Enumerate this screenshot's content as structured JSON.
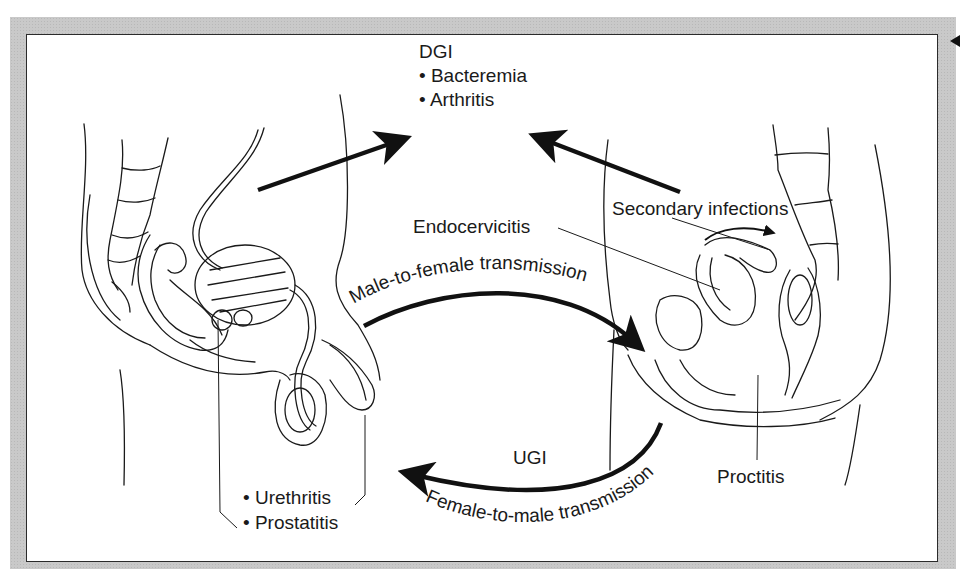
{
  "figure": {
    "top_group": {
      "heading": "DGI",
      "items": [
        "• Bacteremia",
        "• Arthritis"
      ]
    },
    "male": {
      "items": [
        "• Urethritis",
        "• Prostatitis"
      ]
    },
    "female": {
      "secondary": "Secondary infections",
      "endocervicitis": "Endocervicitis",
      "proctitis": "Proctitis"
    },
    "arrows": {
      "male_to_female": "Male-to-female transmission",
      "female_to_male": "Female-to-male transmission",
      "ugi": "UGI"
    },
    "colors": {
      "frame": "#c9c9c9",
      "panel": "#ffffff",
      "ink": "#1a1a1a"
    }
  }
}
